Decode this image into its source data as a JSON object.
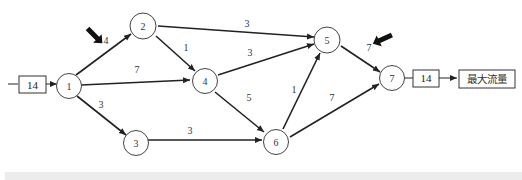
{
  "diagram": {
    "type": "max-flow network",
    "source_box": {
      "label": "14"
    },
    "sink_box": {
      "label": "14"
    },
    "result_box": {
      "label": "最大流量"
    },
    "nodes": [
      {
        "id": "1",
        "label": "1",
        "x": 98,
        "y": 86
      },
      {
        "id": "2",
        "label": "2",
        "x": 143,
        "y": 26
      },
      {
        "id": "3",
        "label": "3",
        "x": 136,
        "y": 143
      },
      {
        "id": "4",
        "label": "4",
        "x": 205,
        "y": 81
      },
      {
        "id": "5",
        "label": "5",
        "x": 328,
        "y": 40
      },
      {
        "id": "6",
        "label": "6",
        "x": 276,
        "y": 142
      },
      {
        "id": "7",
        "label": "7",
        "x": 392,
        "y": 78
      }
    ],
    "edges": [
      {
        "from": "1",
        "to": "2",
        "label": "4",
        "lx": 106,
        "ly": 44
      },
      {
        "from": "1",
        "to": "4",
        "label": "7",
        "lx": 137,
        "ly": 73
      },
      {
        "from": "1",
        "to": "3",
        "label": "3",
        "lx": 101,
        "ly": 108
      },
      {
        "from": "2",
        "to": "5",
        "label": "3",
        "lx": 247,
        "ly": 27
      },
      {
        "from": "2",
        "to": "4",
        "label": "1",
        "lx": 186,
        "ly": 50
      },
      {
        "from": "4",
        "to": "5",
        "label": "3",
        "lx": 250,
        "ly": 56
      },
      {
        "from": "4",
        "to": "6",
        "label": "5",
        "lx": 249,
        "ly": 100
      },
      {
        "from": "3",
        "to": "6",
        "label": "3",
        "lx": 190,
        "ly": 134
      },
      {
        "from": "6",
        "to": "5",
        "label": "1",
        "lx": 294,
        "ly": 92
      },
      {
        "from": "5",
        "to": "7",
        "label": "7",
        "lx": 368,
        "ly": 51
      },
      {
        "from": "6",
        "to": "7",
        "label": "7",
        "lx": 332,
        "ly": 100
      }
    ],
    "highlight_arrows": [
      {
        "name": "arrow-pointer-source",
        "near_edge": "1-2"
      },
      {
        "name": "arrow-pointer-sink",
        "near_edge": "5-7"
      }
    ],
    "colors": {
      "line": "#222222",
      "background": "#ffffff",
      "strip": "#ececec"
    }
  }
}
